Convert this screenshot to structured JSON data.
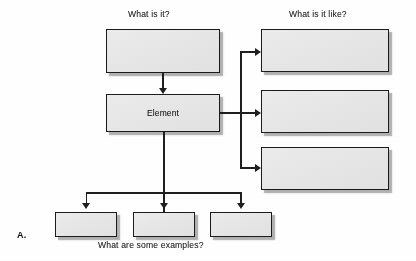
{
  "figure": {
    "label": "A.",
    "type": "concept-definition-map",
    "background_color": "#ffffff",
    "box_fill_color": "#e8e8e8",
    "box_border_color": "#1b1b1b",
    "connector_color": "#1f1f1f"
  },
  "headings": {
    "left": "What is it?",
    "right": "What is it like?",
    "bottom": "What are some examples?"
  },
  "center_node": {
    "label": "Element"
  },
  "definition_box": {
    "label": ""
  },
  "property_boxes": [
    {
      "label": ""
    },
    {
      "label": ""
    },
    {
      "label": ""
    }
  ],
  "example_boxes": [
    {
      "label": ""
    },
    {
      "label": ""
    },
    {
      "label": ""
    }
  ]
}
